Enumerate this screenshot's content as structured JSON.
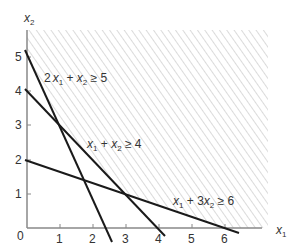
{
  "figure": {
    "type": "linear-programming feasible region",
    "axes": {
      "x_label": "x",
      "x_label_sub": "1",
      "y_label": "x",
      "y_label_sub": "2",
      "origin_label": "0",
      "x_ticks": [
        "1",
        "2",
        "3",
        "4",
        "5",
        "6"
      ],
      "y_ticks": [
        "1",
        "2",
        "3",
        "4",
        "5"
      ]
    },
    "constraints": [
      {
        "id": "c1",
        "label_parts": [
          "2",
          "x",
          "1",
          " + ",
          "x",
          "2",
          " ≥ 5"
        ],
        "text": "2x1 + x2 ≥ 5"
      },
      {
        "id": "c2",
        "label_parts": [
          "",
          "x",
          "1",
          " + ",
          "x",
          "2",
          " ≥ 4"
        ],
        "text": "x1 + x2 ≥ 4"
      },
      {
        "id": "c3",
        "label_parts": [
          "",
          "x",
          "1",
          " + 3",
          "x",
          "2",
          " ≥ 6"
        ],
        "text": "x1 + 3x2 ≥ 6"
      }
    ],
    "feasible_region": "hatched area above all three lines",
    "colors": {
      "line": "#1a1a1a",
      "hatch": "#b8b8b8",
      "axis": "#888888"
    }
  }
}
